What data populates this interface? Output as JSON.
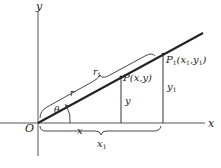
{
  "diagram": {
    "type": "polar-coordinates-similar-triangles",
    "colors": {
      "ink": "#222222",
      "axis": "#555555",
      "background": "#ffffff"
    },
    "axes": {
      "x_label": "x",
      "y_label": "y",
      "origin_label": "O"
    },
    "points": {
      "P": {
        "label": "P(x,y)"
      },
      "P1": {
        "label_main": "P",
        "label_sub": "1",
        "label_rest_open": "(x",
        "label_rest_sub1": "1",
        "label_rest_mid": ",y",
        "label_rest_sub2": "1",
        "label_rest_close": ")"
      }
    },
    "labels": {
      "r": "r",
      "r1_main": "r",
      "r1_sub": "1",
      "theta": "θ",
      "y": "y",
      "y1_main": "y",
      "y1_sub": "1",
      "x": "x",
      "x1_main": "x",
      "x1_sub": "1"
    }
  }
}
